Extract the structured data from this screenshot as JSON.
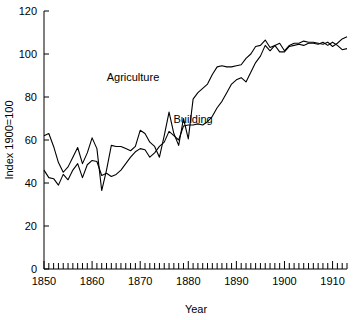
{
  "chart_data": {
    "type": "line",
    "title": "",
    "xlabel": "Year",
    "ylabel": "Index 1900=100",
    "xlim": [
      1850,
      1913
    ],
    "ylim": [
      0,
      120
    ],
    "yticks": [
      0,
      20,
      40,
      60,
      80,
      100,
      120
    ],
    "ytick_labels": [
      "0",
      "20",
      "40",
      "60",
      "80",
      "100",
      "120"
    ],
    "xticks": [
      1850,
      1860,
      1870,
      1880,
      1890,
      1900,
      1910
    ],
    "xtick_labels": [
      "1850",
      "1860",
      "1870",
      "1880",
      "1890",
      "1900",
      "1910"
    ],
    "minor_xtick_step": 1,
    "grid": false,
    "legend_position": "inline-annotation",
    "line_color": "#000000",
    "background_color": "#ffffff",
    "annotations": [
      {
        "text": "Agriculture",
        "x": 1868.5,
        "y": 87.5
      },
      {
        "text": "Building",
        "x": 1881.0,
        "y": 68.0
      }
    ],
    "x": [
      1850,
      1851,
      1852,
      1853,
      1854,
      1855,
      1856,
      1857,
      1858,
      1859,
      1860,
      1861,
      1862,
      1863,
      1864,
      1865,
      1866,
      1867,
      1868,
      1869,
      1870,
      1871,
      1872,
      1873,
      1874,
      1875,
      1876,
      1877,
      1878,
      1879,
      1880,
      1881,
      1882,
      1883,
      1884,
      1885,
      1886,
      1887,
      1888,
      1889,
      1890,
      1891,
      1892,
      1893,
      1894,
      1895,
      1896,
      1897,
      1898,
      1899,
      1900,
      1901,
      1902,
      1903,
      1904,
      1905,
      1906,
      1907,
      1908,
      1909,
      1910,
      1911,
      1912,
      1913
    ],
    "series": [
      {
        "name": "Agriculture",
        "values": [
          62.0,
          63.0,
          57.0,
          49.5,
          45.0,
          47.5,
          52.0,
          56.5,
          49.0,
          54.0,
          61.0,
          56.0,
          36.5,
          46.0,
          57.5,
          57.0,
          57.0,
          56.0,
          55.0,
          57.0,
          64.5,
          63.0,
          59.0,
          57.0,
          52.0,
          62.0,
          73.0,
          63.0,
          57.5,
          70.0,
          60.5,
          79.0,
          82.0,
          84.0,
          86.0,
          90.5,
          94.0,
          94.5,
          94.0,
          94.0,
          94.5,
          95.0,
          98.0,
          100.0,
          103.5,
          104.0,
          106.5,
          103.0,
          104.0,
          105.0,
          101.5,
          104.0,
          105.0,
          105.0,
          106.0,
          105.5,
          105.5,
          105.0,
          104.5,
          105.5,
          103.5,
          105.0,
          107.0,
          108.0
        ]
      },
      {
        "name": "Building",
        "values": [
          46.0,
          42.5,
          42.0,
          39.0,
          44.0,
          41.5,
          46.0,
          49.0,
          42.5,
          48.5,
          50.5,
          50.0,
          43.5,
          44.5,
          43.0,
          44.0,
          46.0,
          49.0,
          52.0,
          54.5,
          56.0,
          55.5,
          52.0,
          54.0,
          57.0,
          59.0,
          64.0,
          62.0,
          60.0,
          66.5,
          67.0,
          67.0,
          67.5,
          67.0,
          68.5,
          71.0,
          75.0,
          78.0,
          82.0,
          86.0,
          88.0,
          89.0,
          87.0,
          91.5,
          96.0,
          99.0,
          104.0,
          101.5,
          104.0,
          101.0,
          101.0,
          103.5,
          104.0,
          104.5,
          104.0,
          105.0,
          105.0,
          104.5,
          105.5,
          104.0,
          105.5,
          104.0,
          102.0,
          102.5
        ]
      }
    ]
  }
}
